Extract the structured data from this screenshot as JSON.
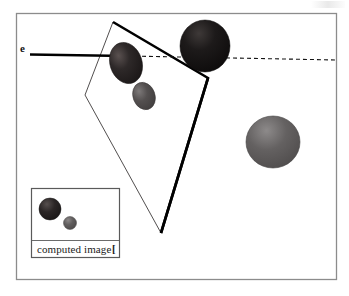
{
  "figure": {
    "background_color": "#ffffff",
    "border": {
      "name": "outer-frame",
      "color": "#8c8c8c",
      "x": 16,
      "y": 13,
      "width": 321,
      "height": 267
    },
    "ray": {
      "label": "e",
      "label_x": 21,
      "label_y": 45,
      "solid": {
        "x1": 30,
        "y1": 54,
        "x2": 128,
        "y2": 56,
        "color": "#000000",
        "width": 2.4
      },
      "arrowhead": {
        "x": 130,
        "y": 56,
        "color": "#000000"
      },
      "dashed": {
        "x1": 130,
        "y1": 56,
        "x2": 337,
        "y2": 60,
        "color": "#111111",
        "dash": "4 3"
      }
    },
    "quad": {
      "name": "viewing-plane-quadrilateral",
      "points": "113,22 208,78 161,233 85,95",
      "thin_edge_color": "#3a3a3a",
      "thick_edge_color": "#000000",
      "thin_width": 0.8,
      "thick_width": 2.6,
      "fill": "#ffffff"
    },
    "spheres": [
      {
        "name": "dark-ellipse-left",
        "cx": 126,
        "cy": 63,
        "rx": 16,
        "ry": 21,
        "rotation": -18,
        "color": "#241f1f",
        "highlight": "#5a5150"
      },
      {
        "name": "black-sphere-top",
        "cx": 205,
        "cy": 46,
        "rx": 25,
        "ry": 26,
        "rotation": 0,
        "color": "#151313",
        "highlight": "#3e3938"
      },
      {
        "name": "gray-ellipse-middle",
        "cx": 144,
        "cy": 96,
        "rx": 11,
        "ry": 14,
        "rotation": -20,
        "color": "#4c4949",
        "highlight": "#767272"
      },
      {
        "name": "gray-sphere-right",
        "cx": 273,
        "cy": 142,
        "rx": 27,
        "ry": 26,
        "rotation": 0,
        "color": "#5e5c5c",
        "highlight": "#8a8787"
      }
    ],
    "inset": {
      "name": "computed-image-inset",
      "x": 31,
      "y": 188,
      "width": 89,
      "height": 70,
      "border_color": "#5a5a5a",
      "border_width": 1.2,
      "caption": "computed image",
      "caption_x": 38,
      "caption_y": 244,
      "caption_marker": "[",
      "divider_y": 240,
      "spheres": [
        {
          "name": "inset-dark-sphere",
          "cx": 50,
          "cy": 209,
          "rx": 11,
          "ry": 11,
          "color": "#262222",
          "highlight": "#514b4a"
        },
        {
          "name": "inset-gray-sphere",
          "cx": 70,
          "cy": 223,
          "rx": 6.5,
          "ry": 6.5,
          "color": "#5c5a5a",
          "highlight": "#878383"
        }
      ]
    }
  }
}
